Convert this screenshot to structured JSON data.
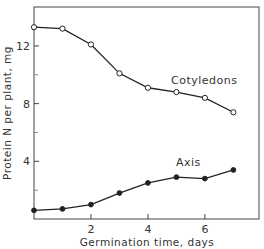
{
  "chart_data": {
    "type": "line",
    "title": "",
    "xlabel": "Germination time, days",
    "ylabel": "Protein N per plant, mg",
    "xlim": [
      0,
      7.9
    ],
    "ylim": [
      0,
      14.7
    ],
    "x_ticks": [
      2,
      4,
      6
    ],
    "x_minor_ticks": [],
    "y_ticks": [
      4,
      8,
      12
    ],
    "y_minor_ticks": [
      2,
      6,
      10
    ],
    "grid": false,
    "legend": "inline labels",
    "x": [
      0,
      1,
      2,
      3,
      4,
      5,
      6,
      7
    ],
    "series": [
      {
        "name": "Cotyledons",
        "marker": "open-circle",
        "values": [
          13.3,
          13.2,
          12.1,
          10.1,
          9.1,
          8.8,
          8.4,
          7.4
        ]
      },
      {
        "name": "Axis",
        "marker": "filled-circle",
        "values": [
          0.6,
          0.7,
          1.0,
          1.8,
          2.5,
          2.9,
          2.8,
          3.4
        ]
      }
    ]
  }
}
